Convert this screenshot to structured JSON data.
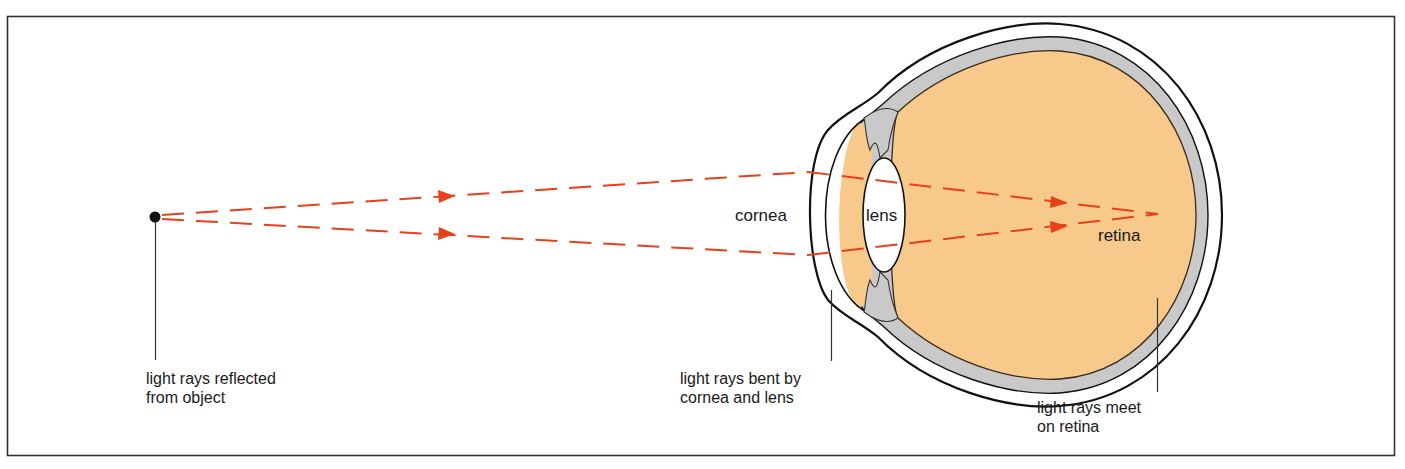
{
  "diagram": {
    "title": "",
    "colors": {
      "frame": "#333333",
      "eye_fill": "#f7c98a",
      "choroid_gray": "#c9c9c9",
      "outline": "#111111",
      "ray": "#e8411a",
      "object_dot": "#111111",
      "leader_line": "#333333"
    },
    "labels": {
      "cornea": "cornea",
      "lens": "lens",
      "retina": "retina"
    },
    "captions": {
      "object": [
        "light rays reflected",
        "from object"
      ],
      "bent": [
        "light rays bent by",
        "cornea and lens"
      ],
      "meet": [
        "light rays meet",
        "on retina"
      ]
    }
  }
}
